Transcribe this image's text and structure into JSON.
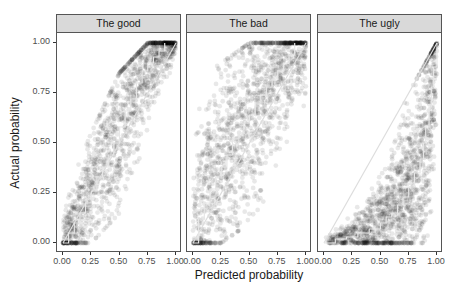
{
  "chart_data": [
    {
      "type": "scatter",
      "title": "The good",
      "xlabel": "Predicted probability",
      "ylabel": "Actual probability",
      "xlim": [
        0,
        1
      ],
      "ylim": [
        0,
        1
      ],
      "x_ticks": [
        "0.00",
        "0.25",
        "0.50",
        "0.75",
        "1.00"
      ],
      "y_ticks": [
        "0.00",
        "0.25",
        "0.50",
        "0.75",
        "1.00"
      ],
      "description": "Dense cloud of semi-transparent black points along the diagonal; white step calibration curve close to the identity line, slightly above at high values.",
      "diagonal_line": [
        [
          0,
          0
        ],
        [
          1,
          1
        ]
      ],
      "calibration_curve": {
        "x": [
          0.0,
          0.05,
          0.1,
          0.15,
          0.2,
          0.25,
          0.3,
          0.35,
          0.4,
          0.45,
          0.5,
          0.55,
          0.6,
          0.65,
          0.7,
          0.75,
          0.8,
          0.85,
          0.9
        ],
        "y": [
          0.0,
          0.05,
          0.1,
          0.15,
          0.2,
          0.26,
          0.33,
          0.38,
          0.44,
          0.5,
          0.58,
          0.66,
          0.72,
          0.8,
          0.86,
          0.9,
          0.93,
          0.96,
          1.0
        ]
      },
      "point_band": {
        "x": [
          0,
          0.25,
          0.5,
          0.75,
          1.0
        ],
        "y_low": [
          0,
          0.0,
          0.15,
          0.45,
          0.9
        ],
        "y_high": [
          0.2,
          0.55,
          0.85,
          1.0,
          1.0
        ]
      }
    },
    {
      "type": "scatter",
      "title": "The bad",
      "xlim": [
        0,
        1
      ],
      "ylim": [
        0,
        1
      ],
      "x_ticks": [
        "0.00",
        "0.25",
        "0.50",
        "0.75",
        "1.00"
      ],
      "y_ticks": [
        "0.00",
        "0.25",
        "0.50",
        "0.75",
        "1.00"
      ],
      "description": "Wide diffuse cloud of points; calibration curve lies above the diagonal (underconfident predictions).",
      "diagonal_line": [
        [
          0,
          0
        ],
        [
          1,
          1
        ]
      ],
      "calibration_curve": {
        "x": [
          0.0,
          0.05,
          0.1,
          0.15,
          0.2,
          0.25,
          0.3,
          0.35,
          0.4,
          0.45,
          0.5,
          0.55,
          0.6,
          0.65,
          0.7,
          0.75,
          0.8,
          0.85,
          0.9
        ],
        "y": [
          0.0,
          0.12,
          0.2,
          0.27,
          0.33,
          0.38,
          0.44,
          0.52,
          0.55,
          0.6,
          0.64,
          0.7,
          0.74,
          0.78,
          0.82,
          0.86,
          0.9,
          0.94,
          1.0
        ]
      },
      "point_band": {
        "x": [
          0,
          0.25,
          0.5,
          0.75,
          1.0
        ],
        "y_low": [
          0,
          0.0,
          0.1,
          0.3,
          0.6
        ],
        "y_high": [
          0.8,
          0.9,
          1.0,
          1.0,
          1.0
        ]
      }
    },
    {
      "type": "scatter",
      "title": "The ugly",
      "xlim": [
        0,
        1
      ],
      "ylim": [
        0,
        1
      ],
      "x_ticks": [
        "0.00",
        "0.25",
        "0.50",
        "0.75",
        "1.00"
      ],
      "y_ticks": [
        "0.00",
        "0.25",
        "0.50",
        "0.75",
        "1.00"
      ],
      "description": "Points concentrated below the diagonal forming a convex curve; calibration curve well below the identity line (overconfident).",
      "diagonal_line": [
        [
          0,
          0
        ],
        [
          1,
          1
        ]
      ],
      "calibration_curve": {
        "x": [
          0.0,
          0.1,
          0.2,
          0.3,
          0.4,
          0.5,
          0.55,
          0.6,
          0.65,
          0.7,
          0.75,
          0.8,
          0.85,
          0.88,
          0.9,
          0.93,
          0.95,
          0.97,
          1.0
        ],
        "y": [
          0.0,
          0.02,
          0.03,
          0.05,
          0.07,
          0.1,
          0.13,
          0.15,
          0.19,
          0.23,
          0.28,
          0.35,
          0.42,
          0.5,
          0.58,
          0.68,
          0.78,
          0.88,
          1.0
        ]
      },
      "point_band": {
        "x": [
          0,
          0.25,
          0.5,
          0.75,
          1.0
        ],
        "y_low": [
          0,
          0.0,
          0.0,
          0.0,
          0.0
        ],
        "y_high": [
          0.05,
          0.15,
          0.4,
          0.75,
          1.0
        ]
      }
    }
  ],
  "axes": {
    "xlabel": "Predicted probability",
    "ylabel": "Actual probability",
    "y_ticks": [
      "1.00",
      "0.75",
      "0.50",
      "0.25",
      "0.00"
    ],
    "x_ticks": [
      "0.00",
      "0.25",
      "0.50",
      "0.75",
      "1.00"
    ]
  },
  "panels": [
    {
      "title": "The good"
    },
    {
      "title": "The bad"
    },
    {
      "title": "The ugly"
    }
  ],
  "colors": {
    "points": "#000000",
    "calibration_line": "#e6e6e6",
    "diagonal": "#dddddd",
    "strip_bg": "#d9d9d9"
  }
}
